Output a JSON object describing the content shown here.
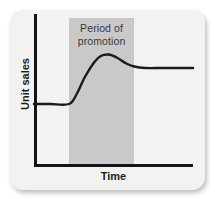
{
  "figure": {
    "background_color": "#f2f2f0",
    "band_color": "#c9c9c9",
    "line_color": "#1a1a1a",
    "axis_color": "#131313"
  },
  "chart_data": {
    "type": "line",
    "title": "",
    "xlabel": "Time",
    "ylabel": "Unit sales",
    "grid": false,
    "legend": null,
    "axis_ticks": {
      "x": [],
      "y": []
    },
    "xlim": [
      0,
      100
    ],
    "ylim": [
      0,
      100
    ],
    "annotations": [
      {
        "name": "promotion-band",
        "label_line1": "Period of",
        "label_line2": "promotion",
        "label_full": "Period of promotion",
        "x_start": 22,
        "x_end": 63,
        "shading": "#c9c9c9"
      }
    ],
    "series": [
      {
        "name": "Unit sales",
        "x": [
          0,
          10,
          22,
          27,
          32,
          38,
          42,
          47,
          52,
          58,
          63,
          70,
          80,
          90,
          100
        ],
        "y": [
          40,
          40,
          40,
          47,
          58,
          68,
          72,
          73,
          71,
          67,
          65,
          64,
          64,
          64,
          64
        ],
        "description": "Flat baseline before promotion, sharp rise during promotion, peak then slight decay settling above the original baseline"
      }
    ]
  }
}
